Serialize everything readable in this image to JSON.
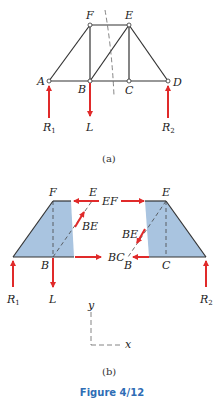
{
  "figure_title": "Figure 4/12",
  "colors": {
    "member": "#333333",
    "force": "#e02a2a",
    "shade": "#a9c4e0",
    "caption": "#2e6db5"
  },
  "part_a": {
    "caption": "(a)",
    "nodes": {
      "A": "A",
      "B": "B",
      "C": "C",
      "D": "D",
      "E": "E",
      "F": "F"
    },
    "forces": {
      "R1": "R",
      "R1_sub": "1",
      "L": "L",
      "R2": "R",
      "R2_sub": "2"
    }
  },
  "part_b": {
    "caption": "(b)",
    "left_section": {
      "F": "F",
      "E": "E",
      "B": "B",
      "BE": "BE",
      "EF_force": "EF",
      "BC_force": "BC"
    },
    "right_section": {
      "E": "E",
      "C": "C",
      "B": "B",
      "BE": "BE",
      "BC": "BC"
    },
    "forces": {
      "R1": "R",
      "R1_sub": "1",
      "L": "L",
      "R2": "R",
      "R2_sub": "2"
    },
    "axes": {
      "x": "x",
      "y": "y"
    }
  }
}
